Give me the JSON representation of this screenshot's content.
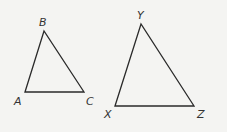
{
  "figure": {
    "triangles": [
      {
        "name": "ABC",
        "vertices": [
          {
            "label": "A",
            "x": 25,
            "y": 92,
            "lx": 14,
            "ly": 105
          },
          {
            "label": "B",
            "x": 44,
            "y": 31,
            "lx": 39,
            "ly": 26
          },
          {
            "label": "C",
            "x": 84,
            "y": 92,
            "lx": 86,
            "ly": 105
          }
        ]
      },
      {
        "name": "XYZ",
        "vertices": [
          {
            "label": "X",
            "x": 115,
            "y": 106,
            "lx": 104,
            "ly": 118
          },
          {
            "label": "Y",
            "x": 141,
            "y": 24,
            "lx": 137,
            "ly": 19
          },
          {
            "label": "Z",
            "x": 194,
            "y": 106,
            "lx": 197,
            "ly": 118
          }
        ]
      }
    ],
    "stroke_color": "#2a2a2a",
    "background_color": "#f4f4f2"
  }
}
